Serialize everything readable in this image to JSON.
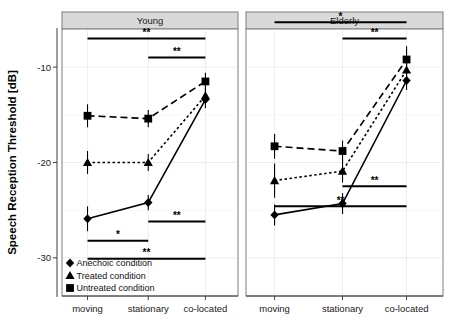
{
  "chart_data": {
    "type": "line",
    "title": "",
    "xlabel": "",
    "ylabel": "Speech Reception Threshold [dB]",
    "categories": [
      "moving",
      "stationary",
      "co-located"
    ],
    "ylim": [
      -34,
      -6
    ],
    "yticks": [
      -10,
      -20,
      -30
    ],
    "ytick_labels": [
      "-10",
      "-20",
      "-30"
    ],
    "grid": true,
    "legend_position": "inside-bottom-left",
    "panels": [
      {
        "name": "Young",
        "series": [
          {
            "name": "Anechoic condition",
            "marker": "circle",
            "linestyle": "solid",
            "values": [
              -25.9,
              -24.2,
              -13.4
            ],
            "errors": [
              1.3,
              0.8,
              0.9
            ]
          },
          {
            "name": "Treated condition",
            "marker": "triangle",
            "linestyle": "dotted",
            "values": [
              -20.0,
              -20.0,
              -13.0
            ],
            "errors": [
              1.2,
              0.9,
              0.9
            ]
          },
          {
            "name": "Untreated condition",
            "marker": "square",
            "linestyle": "dashed",
            "values": [
              -15.1,
              -15.4,
              -11.5
            ],
            "errors": [
              1.2,
              0.9,
              0.9
            ]
          }
        ],
        "significance": [
          {
            "from": "moving",
            "to": "co-located",
            "label": "**",
            "y": -7.0
          },
          {
            "from": "stationary",
            "to": "co-located",
            "label": "**",
            "y": -9.0
          },
          {
            "from": "stationary",
            "to": "co-located",
            "label": "**",
            "y": -26.2
          },
          {
            "from": "moving",
            "to": "stationary",
            "label": "*",
            "y": -28.2
          },
          {
            "from": "moving",
            "to": "co-located",
            "label": "**",
            "y": -30.1
          }
        ]
      },
      {
        "name": "Elderly",
        "series": [
          {
            "name": "Anechoic condition",
            "marker": "circle",
            "linestyle": "solid",
            "values": [
              -25.5,
              -24.3,
              -11.4
            ],
            "errors": [
              1.1,
              1.1,
              1.0
            ]
          },
          {
            "name": "Treated condition",
            "marker": "triangle",
            "linestyle": "dotted",
            "values": [
              -21.9,
              -20.9,
              -10.3
            ],
            "errors": [
              1.8,
              1.2,
              1.2
            ]
          },
          {
            "name": "Untreated condition",
            "marker": "square",
            "linestyle": "dashed",
            "values": [
              -18.3,
              -18.8,
              -9.2
            ],
            "errors": [
              1.3,
              1.1,
              1.4
            ]
          }
        ],
        "significance": [
          {
            "from": "moving",
            "to": "co-located",
            "label": "*",
            "y": -5.3
          },
          {
            "from": "stationary",
            "to": "co-located",
            "label": "**",
            "y": -7.0
          },
          {
            "from": "stationary",
            "to": "co-located",
            "label": "**",
            "y": -22.5
          },
          {
            "from": "moving",
            "to": "co-located",
            "label": "**",
            "y": -24.6
          }
        ]
      }
    ],
    "legend": [
      {
        "label": "Anechoic condition",
        "marker": "circle"
      },
      {
        "label": "Treated condition",
        "marker": "triangle"
      },
      {
        "label": "Untreated condition",
        "marker": "square"
      }
    ],
    "colors": {
      "series": "#000000",
      "panel_strip": "#d9d9d9",
      "grid": "#e8e8e8",
      "background": "#ffffff"
    }
  }
}
